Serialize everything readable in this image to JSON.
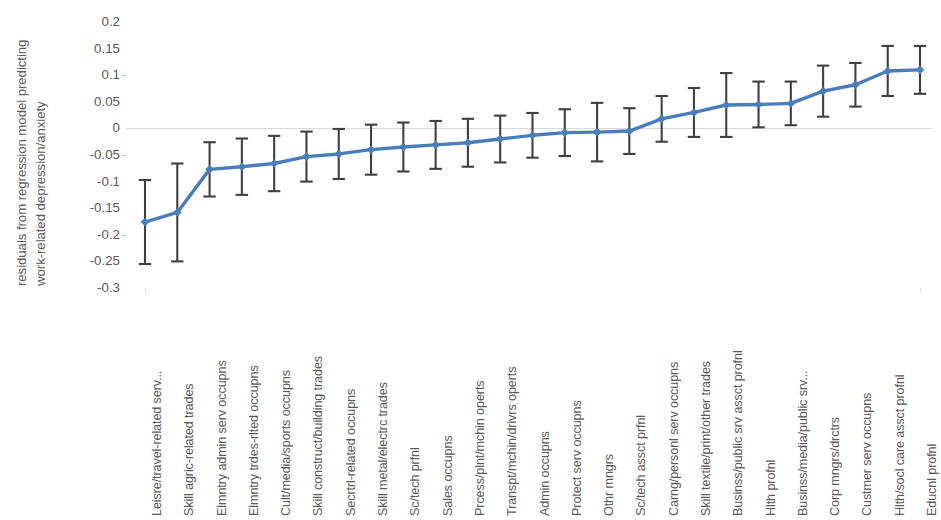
{
  "chart_data": {
    "type": "line",
    "title": "",
    "subtitle": "",
    "xlabel": "",
    "ylabel": "residuals from regression model predicting work-related depression/anxiety",
    "ylabel_lines": [
      "residuals from regression model predicting",
      "work-related depression/anxiety"
    ],
    "ylim": [
      -0.3,
      0.2
    ],
    "yticks": [
      0.2,
      0.15,
      0.1,
      0.05,
      0,
      -0.05,
      -0.1,
      -0.15,
      -0.2,
      -0.25,
      -0.3
    ],
    "ytick_labels": [
      "0.2",
      "0.15",
      "0.1",
      "0.05",
      "0",
      "-0.05",
      "-0.1",
      "-0.15",
      "-0.2",
      "-0.25",
      "-0.3"
    ],
    "grid": false,
    "zero_line": true,
    "legend": "none",
    "marker": "diamond",
    "series_color": "#4a7ebb",
    "errorbar_color": "#404040",
    "categories": [
      "Leisre/travel-related serv...",
      "Skill agric-related trades",
      "Elmntry admin serv occupns",
      "Elmntry trdes-rlted occupns",
      "Cult/media/sports occupns",
      "Skill construct/building trades",
      "Secrtrl-related occupns",
      "Skill metal/electrc trades",
      "Sc/tech prfnl",
      "Sales occupns",
      "Prcess/plnt/mchin operts",
      "Transpt/mchin/drivrs operts",
      "Admin occupns",
      "Protect serv occupns",
      "Othr mngrs",
      "Sc/tech assct prfnl",
      "Carng/personl serv occupns",
      "Skill textile/print/other trades",
      "Businss/public srv assct profnl",
      "Hlth profnl",
      "Businss/media/public srv...",
      "Corp mngrs/drctrs",
      "Custmer serv occupns",
      "Hlth/socl care assct profnl",
      "Educnl profnl"
    ],
    "values": [
      -0.176,
      -0.158,
      -0.077,
      -0.072,
      -0.066,
      -0.053,
      -0.048,
      -0.04,
      -0.035,
      -0.031,
      -0.027,
      -0.02,
      -0.013,
      -0.008,
      -0.007,
      -0.005,
      0.018,
      0.03,
      0.044,
      0.045,
      0.047,
      0.07,
      0.082,
      0.108,
      0.11
    ],
    "errors": [
      0.079,
      0.092,
      0.051,
      0.053,
      0.052,
      0.047,
      0.047,
      0.047,
      0.046,
      0.045,
      0.045,
      0.044,
      0.042,
      0.044,
      0.055,
      0.043,
      0.043,
      0.046,
      0.06,
      0.043,
      0.041,
      0.048,
      0.041,
      0.047,
      0.045
    ],
    "series": [
      {
        "name": "residual",
        "values": [
          -0.176,
          -0.158,
          -0.077,
          -0.072,
          -0.066,
          -0.053,
          -0.048,
          -0.04,
          -0.035,
          -0.031,
          -0.027,
          -0.02,
          -0.013,
          -0.008,
          -0.007,
          -0.005,
          0.018,
          0.03,
          0.044,
          0.045,
          0.047,
          0.07,
          0.082,
          0.108,
          0.11
        ]
      }
    ]
  }
}
